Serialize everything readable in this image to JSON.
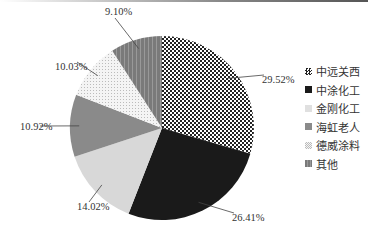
{
  "chart_data": {
    "type": "pie",
    "title": "",
    "categories": [
      "中远关西",
      "中涂化工",
      "金刚化工",
      "海虹老人",
      "德威涂料",
      "其他"
    ],
    "values": [
      29.52,
      26.41,
      14.02,
      10.92,
      10.03,
      9.1
    ],
    "labels": [
      "29.52%",
      "26.41%",
      "14.02%",
      "10.92%",
      "10.03%",
      "9.10%"
    ],
    "legend_position": "right",
    "start_angle": "12 o'clock, clockwise"
  },
  "legend": {
    "items": [
      {
        "label": "中远关西"
      },
      {
        "label": "中涂化工"
      },
      {
        "label": "金刚化工"
      },
      {
        "label": "海虹老人"
      },
      {
        "label": "德威涂料"
      },
      {
        "label": "其他"
      }
    ]
  }
}
